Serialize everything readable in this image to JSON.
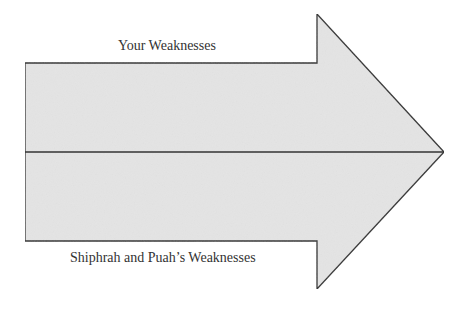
{
  "diagram": {
    "type": "arrow",
    "direction": "right",
    "fill_color": "#e4e4e4",
    "stroke_color": "#333333",
    "sections": [
      {
        "position": "top",
        "label": "Your Weaknesses"
      },
      {
        "position": "bottom",
        "label": "Shiphrah and Puah’s Weaknesses"
      }
    ]
  }
}
